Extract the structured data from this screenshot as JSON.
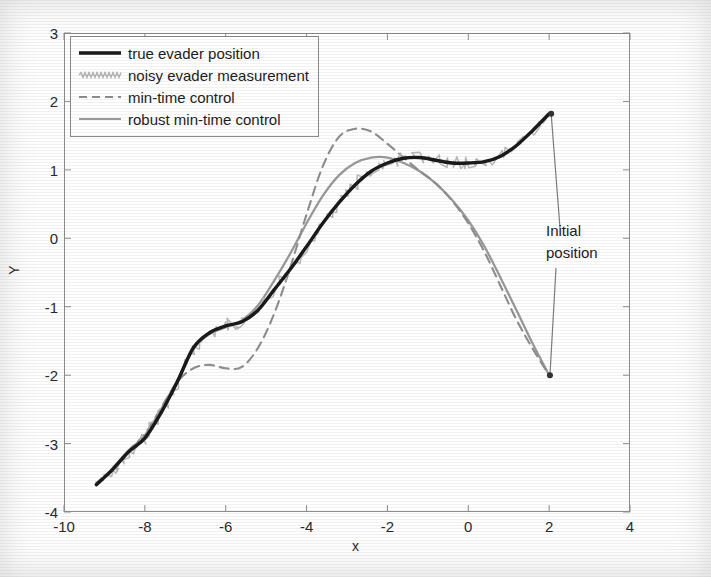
{
  "figure": {
    "xlabel": "x",
    "ylabel": "Y"
  },
  "annotation": {
    "line1": "Initial",
    "line2": "position"
  },
  "legend": {
    "items": [
      {
        "label": "true evader position",
        "style": "solid-thick",
        "color": "#1a1a1a"
      },
      {
        "label": "noisy evader measurement",
        "style": "noisy",
        "color": "#b4b4b4"
      },
      {
        "label": "min-time control",
        "style": "dashed",
        "color": "#8f8f8f"
      },
      {
        "label": "robust min-time control",
        "style": "solid-thin",
        "color": "#9a9a9a"
      }
    ]
  },
  "chart_data": {
    "type": "line",
    "title": "",
    "xlabel": "x",
    "ylabel": "Y",
    "xlim": [
      -10,
      4
    ],
    "ylim": [
      -4,
      3
    ],
    "xticks": [
      -10,
      -8,
      -6,
      -4,
      -2,
      0,
      2,
      4
    ],
    "yticks": [
      -4,
      -3,
      -2,
      -1,
      0,
      1,
      2,
      3
    ],
    "grid": false,
    "legend_position": "upper left",
    "annotations": [
      {
        "text": "Initial position",
        "xy_text": [
          2.55,
          0.25
        ],
        "arrows": [
          [
            2.05,
            1.82
          ],
          [
            2.02,
            -2.0
          ]
        ]
      }
    ],
    "series": [
      {
        "name": "true evader position",
        "style": "solid-thick",
        "color": "#1a1a1a",
        "x": [
          -9.2,
          -8.8,
          -8.4,
          -8.0,
          -7.6,
          -7.2,
          -6.8,
          -6.4,
          -6.0,
          -5.6,
          -5.2,
          -4.8,
          -4.4,
          -4.0,
          -3.6,
          -3.2,
          -2.8,
          -2.4,
          -2.0,
          -1.6,
          -1.2,
          -0.8,
          -0.4,
          0.0,
          0.4,
          0.8,
          1.2,
          1.6,
          2.0
        ],
        "y": [
          -3.6,
          -3.38,
          -3.12,
          -2.92,
          -2.55,
          -2.1,
          -1.6,
          -1.38,
          -1.28,
          -1.22,
          -1.05,
          -0.75,
          -0.45,
          -0.12,
          0.22,
          0.52,
          0.78,
          0.98,
          1.1,
          1.17,
          1.18,
          1.14,
          1.1,
          1.1,
          1.12,
          1.2,
          1.36,
          1.58,
          1.82
        ]
      },
      {
        "name": "noisy evader measurement",
        "style": "noisy",
        "color": "#b4b4b4",
        "note": "jagged noise band of amplitude ~0.12 about the true evader position"
      },
      {
        "name": "min-time control",
        "style": "dashed",
        "color": "#8f8f8f",
        "x": [
          -9.2,
          -8.8,
          -8.4,
          -8.0,
          -7.6,
          -7.2,
          -6.8,
          -6.4,
          -6.0,
          -5.6,
          -5.2,
          -4.8,
          -4.4,
          -4.0,
          -3.6,
          -3.2,
          -2.8,
          -2.4,
          -2.0,
          -1.6,
          -1.2,
          -0.8,
          -0.4,
          0.0,
          0.4,
          0.8,
          1.2,
          1.6,
          2.0
        ],
        "y": [
          -3.6,
          -3.38,
          -3.1,
          -2.86,
          -2.48,
          -2.1,
          -1.9,
          -1.85,
          -1.9,
          -1.88,
          -1.6,
          -1.1,
          -0.42,
          0.35,
          1.05,
          1.48,
          1.6,
          1.56,
          1.38,
          1.18,
          0.98,
          0.8,
          0.55,
          0.22,
          -0.2,
          -0.7,
          -1.2,
          -1.62,
          -2.0
        ]
      },
      {
        "name": "robust min-time control",
        "style": "solid-thin",
        "color": "#9a9a9a",
        "x": [
          -9.2,
          -8.8,
          -8.4,
          -8.0,
          -7.6,
          -7.2,
          -6.8,
          -6.4,
          -6.0,
          -5.6,
          -5.2,
          -4.8,
          -4.4,
          -4.0,
          -3.6,
          -3.2,
          -2.8,
          -2.4,
          -2.0,
          -1.6,
          -1.2,
          -0.8,
          -0.4,
          0.0,
          0.4,
          0.8,
          1.2,
          1.6,
          2.0
        ],
        "y": [
          -3.6,
          -3.36,
          -3.1,
          -2.88,
          -2.5,
          -2.08,
          -1.62,
          -1.4,
          -1.3,
          -1.2,
          -0.98,
          -0.62,
          -0.22,
          0.22,
          0.62,
          0.92,
          1.1,
          1.18,
          1.18,
          1.1,
          0.98,
          0.8,
          0.56,
          0.26,
          -0.12,
          -0.58,
          -1.06,
          -1.55,
          -2.0
        ]
      }
    ]
  }
}
